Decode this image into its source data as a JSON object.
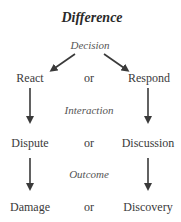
{
  "title": "Difference",
  "stages": [
    {
      "label": "Decision",
      "left": "React",
      "connector": "or",
      "right": "Respond"
    },
    {
      "label": "Interaction",
      "left": "Dispute",
      "connector": "or",
      "right": "Discussion"
    },
    {
      "label": "Outcome",
      "left": "Damage",
      "connector": "or",
      "right": "Discovery"
    }
  ],
  "colors": {
    "text": "#3a3a3a",
    "arrow": "#3a3a3a"
  }
}
